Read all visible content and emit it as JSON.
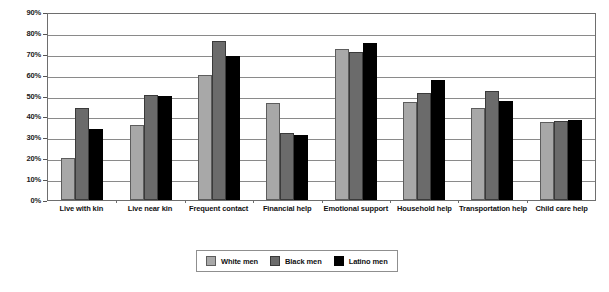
{
  "chart_data": {
    "type": "bar",
    "title": "",
    "subtitle": "",
    "xlabel": "",
    "ylabel": "",
    "ylim": [
      0,
      90
    ],
    "ytick_labels": [
      "90%",
      "80%",
      "70%",
      "60%",
      "50%",
      "40%",
      "30%",
      "20%",
      "10%",
      "0%"
    ],
    "ytick_values": [
      90,
      80,
      70,
      60,
      50,
      40,
      30,
      20,
      10,
      0
    ],
    "grid": "horizontal",
    "legend_position": "bottom-center",
    "categories": [
      "Live with kin",
      "Live near kin",
      "Frequent contact",
      "Financial help",
      "Emotional support",
      "Household help",
      "Transportation help",
      "Child care help"
    ],
    "series": [
      {
        "name": "White men",
        "color": "#a8a8a8",
        "values": [
          20,
          36,
          60,
          46.5,
          72.5,
          47,
          44,
          37.5
        ]
      },
      {
        "name": "Black men",
        "color": "#6b6b6b",
        "values": [
          44,
          50.5,
          76,
          32,
          71,
          51,
          52,
          38
        ]
      },
      {
        "name": "Latino men",
        "color": "#000000",
        "values": [
          34,
          50,
          69,
          31,
          75,
          57.5,
          47.5,
          38.5
        ]
      }
    ]
  },
  "legend": {
    "items": [
      {
        "label": "White men"
      },
      {
        "label": "Black men"
      },
      {
        "label": "Latino men"
      }
    ]
  }
}
